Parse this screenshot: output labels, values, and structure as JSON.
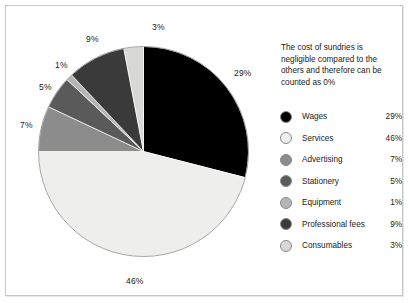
{
  "caption": "The cost of sundries is negligible compared to the others and therefore can be counted as 0%",
  "legend": {
    "rows": [
      {
        "name": "Wages",
        "pct": "29%",
        "color": "#000000"
      },
      {
        "name": "Services",
        "pct": "46%",
        "color": "#eeeeec"
      },
      {
        "name": "Advertising",
        "pct": "7%",
        "color": "#8c8c8c"
      },
      {
        "name": "Stationery",
        "pct": "5%",
        "color": "#5a5a5a"
      },
      {
        "name": "Equipment",
        "pct": "1%",
        "color": "#b5b5b5"
      },
      {
        "name": "Professional fees",
        "pct": "9%",
        "color": "#3a3a3a"
      },
      {
        "name": "Consumables",
        "pct": "3%",
        "color": "#d8d8d6"
      }
    ]
  },
  "chart_data": {
    "type": "pie",
    "title": "",
    "categories": [
      "Wages",
      "Services",
      "Advertising",
      "Stationery",
      "Equipment",
      "Professional fees",
      "Consumables"
    ],
    "values": [
      29,
      46,
      7,
      5,
      1,
      9,
      3
    ],
    "labels": [
      "29%",
      "46%",
      "7%",
      "5%",
      "1%",
      "9%",
      "3%"
    ],
    "colors": [
      "#000000",
      "#eeeeec",
      "#8c8c8c",
      "#5a5a5a",
      "#b5b5b5",
      "#3a3a3a",
      "#d8d8d6"
    ],
    "units": "percent",
    "total": 100,
    "start_angle_deg": 0,
    "direction": "clockwise",
    "legend_position": "right",
    "annotation": "The cost of sundries is negligible compared to the others and therefore can be counted as 0%",
    "label_placement": "outside",
    "label_positions": [
      {
        "label": "29%",
        "x": 228,
        "y": 62
      },
      {
        "label": "46%",
        "x": 120,
        "y": 270
      },
      {
        "label": "7%",
        "x": 14,
        "y": 114
      },
      {
        "label": "5%",
        "x": 33,
        "y": 76
      },
      {
        "label": "1%",
        "x": 49,
        "y": 54
      },
      {
        "label": "9%",
        "x": 80,
        "y": 28
      },
      {
        "label": "3%",
        "x": 146,
        "y": 16
      }
    ]
  }
}
